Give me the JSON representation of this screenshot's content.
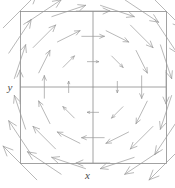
{
  "figure": {
    "kind": "vector-field-plot",
    "background_color": "#ffffff",
    "frame": {
      "x": 20,
      "y": 11,
      "width": 146,
      "height": 152,
      "stroke_color": "#8c8c8c",
      "stroke_width": 0.8
    },
    "center_axes": {
      "stroke_color": "#8c8c8c",
      "stroke_width": 0.8,
      "x_center": 93,
      "y_center": 87
    },
    "arrows": {
      "stroke_color": "#9a9a9a",
      "stroke_width": 0.7,
      "head_length": 2.6,
      "head_angle_deg": 24
    }
  },
  "labels": {
    "x_axis": "x",
    "y_axis": "y"
  },
  "chart_data": {
    "type": "quiver",
    "title": "",
    "xlabel": "x",
    "ylabel": "y",
    "xlim": [
      -3,
      3
    ],
    "ylim": [
      -3,
      3
    ],
    "grid": false,
    "legend": null,
    "rotation": "clockwise",
    "field_description": "Rotational (vortex) vector field; arrow length increases with distance from origin; vectors circulate clockwise about the origin.",
    "field_formula": {
      "u": "y",
      "v": "-x"
    },
    "grid_points": {
      "x": [
        -3,
        -2,
        -1,
        0,
        1,
        2,
        3
      ],
      "y": [
        -3,
        -2,
        -1,
        0,
        1,
        2,
        3
      ]
    },
    "vectors": [
      {
        "x": -3,
        "y": 3,
        "u": 3,
        "v": 3
      },
      {
        "x": -2,
        "y": 3,
        "u": 3,
        "v": 2
      },
      {
        "x": -1,
        "y": 3,
        "u": 3,
        "v": 1
      },
      {
        "x": 0,
        "y": 3,
        "u": 3,
        "v": 0
      },
      {
        "x": 1,
        "y": 3,
        "u": 3,
        "v": -1
      },
      {
        "x": 2,
        "y": 3,
        "u": 3,
        "v": -2
      },
      {
        "x": 3,
        "y": 3,
        "u": 3,
        "v": -3
      },
      {
        "x": -3,
        "y": 2,
        "u": 2,
        "v": 3
      },
      {
        "x": -2,
        "y": 2,
        "u": 2,
        "v": 2
      },
      {
        "x": -1,
        "y": 2,
        "u": 2,
        "v": 1
      },
      {
        "x": 0,
        "y": 2,
        "u": 2,
        "v": 0
      },
      {
        "x": 1,
        "y": 2,
        "u": 2,
        "v": -1
      },
      {
        "x": 2,
        "y": 2,
        "u": 2,
        "v": -2
      },
      {
        "x": 3,
        "y": 2,
        "u": 2,
        "v": -3
      },
      {
        "x": -3,
        "y": 1,
        "u": 1,
        "v": 3
      },
      {
        "x": -2,
        "y": 1,
        "u": 1,
        "v": 2
      },
      {
        "x": -1,
        "y": 1,
        "u": 1,
        "v": 1
      },
      {
        "x": 0,
        "y": 1,
        "u": 1,
        "v": 0
      },
      {
        "x": 1,
        "y": 1,
        "u": 1,
        "v": -1
      },
      {
        "x": 2,
        "y": 1,
        "u": 1,
        "v": -2
      },
      {
        "x": 3,
        "y": 1,
        "u": 1,
        "v": -3
      },
      {
        "x": -3,
        "y": 0,
        "u": 0,
        "v": 3
      },
      {
        "x": -2,
        "y": 0,
        "u": 0,
        "v": 2
      },
      {
        "x": -1,
        "y": 0,
        "u": 0,
        "v": 1
      },
      {
        "x": 0,
        "y": 0,
        "u": 0,
        "v": 0
      },
      {
        "x": 1,
        "y": 0,
        "u": 0,
        "v": -1
      },
      {
        "x": 2,
        "y": 0,
        "u": 0,
        "v": -2
      },
      {
        "x": 3,
        "y": 0,
        "u": 0,
        "v": -3
      },
      {
        "x": -3,
        "y": -1,
        "u": -1,
        "v": 3
      },
      {
        "x": -2,
        "y": -1,
        "u": -1,
        "v": 2
      },
      {
        "x": -1,
        "y": -1,
        "u": -1,
        "v": 1
      },
      {
        "x": 0,
        "y": -1,
        "u": -1,
        "v": 0
      },
      {
        "x": 1,
        "y": -1,
        "u": -1,
        "v": -1
      },
      {
        "x": 2,
        "y": -1,
        "u": -1,
        "v": -2
      },
      {
        "x": 3,
        "y": -1,
        "u": -1,
        "v": -3
      },
      {
        "x": -3,
        "y": -2,
        "u": -2,
        "v": 3
      },
      {
        "x": -2,
        "y": -2,
        "u": -2,
        "v": 2
      },
      {
        "x": -1,
        "y": -2,
        "u": -2,
        "v": 1
      },
      {
        "x": 0,
        "y": -2,
        "u": -2,
        "v": 0
      },
      {
        "x": 1,
        "y": -2,
        "u": -2,
        "v": -1
      },
      {
        "x": 2,
        "y": -2,
        "u": -2,
        "v": -2
      },
      {
        "x": 3,
        "y": -2,
        "u": -2,
        "v": -3
      },
      {
        "x": -3,
        "y": -3,
        "u": -3,
        "v": 3
      },
      {
        "x": -2,
        "y": -3,
        "u": -3,
        "v": 2
      },
      {
        "x": -1,
        "y": -3,
        "u": -3,
        "v": 1
      },
      {
        "x": 0,
        "y": -3,
        "u": -3,
        "v": 0
      },
      {
        "x": 1,
        "y": -3,
        "u": -3,
        "v": -1
      },
      {
        "x": 2,
        "y": -3,
        "u": -3,
        "v": -2
      },
      {
        "x": 3,
        "y": -3,
        "u": -3,
        "v": -3
      }
    ]
  }
}
